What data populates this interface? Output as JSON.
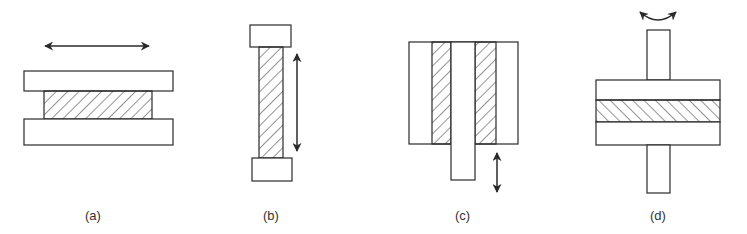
{
  "figure": {
    "colors": {
      "stroke": "#2a2a2a",
      "fill": "#ffffff",
      "label": "#333333"
    },
    "panels": [
      {
        "id": "a",
        "label": "(a)",
        "motion": "horizontal-double-arrow",
        "config": "sandwich shear between two plates"
      },
      {
        "id": "b",
        "label": "(b)",
        "motion": "vertical-double-arrow",
        "config": "tension/compression rod between end caps"
      },
      {
        "id": "c",
        "label": "(c)",
        "motion": "vertical-double-arrow",
        "config": "double-lap shear with central shaft"
      },
      {
        "id": "d",
        "label": "(d)",
        "motion": "rotation-arrow",
        "config": "torsion of disc between plates on shaft"
      }
    ]
  }
}
